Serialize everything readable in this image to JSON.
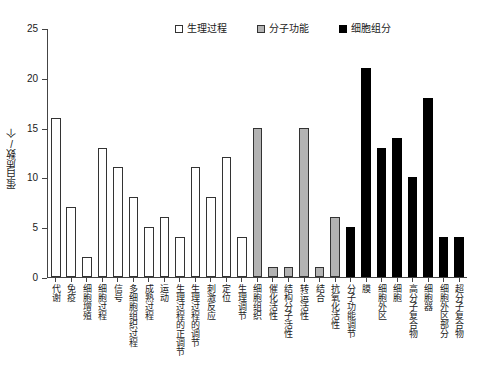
{
  "chart_data": {
    "type": "bar",
    "title": "",
    "xlabel": "",
    "ylabel": "蛋白质数/个",
    "ylim": [
      0,
      25
    ],
    "yticks": [
      0,
      5,
      10,
      15,
      20,
      25
    ],
    "grid": false,
    "legend_position": "top-right",
    "categories": [
      "代谢",
      "免疫",
      "细胞增殖",
      "细胞过程",
      "信号",
      "多细胞组织过程",
      "成熟过程",
      "运动",
      "生理过程的正调节",
      "生理过程的调节",
      "刺激反应",
      "定位",
      "生理调节",
      "细胞组织",
      "催化活性",
      "结构分子活性",
      "转运活性",
      "结合",
      "抗氧化活性",
      "分子功能调节",
      "膜",
      "细胞外区",
      "细胞",
      "高分子复合物",
      "细胞器",
      "细胞外区部分",
      "超分子复合物"
    ],
    "values": [
      16,
      7,
      2,
      13,
      11,
      8,
      5,
      6,
      4,
      11,
      8,
      12,
      4,
      15,
      1,
      1,
      15,
      1,
      6,
      5,
      21,
      13,
      14,
      10,
      18,
      4,
      4
    ],
    "groups": [
      "bp",
      "bp",
      "bp",
      "bp",
      "bp",
      "bp",
      "bp",
      "bp",
      "bp",
      "bp",
      "bp",
      "bp",
      "bp",
      "mf",
      "mf",
      "mf",
      "mf",
      "mf",
      "mf",
      "cc",
      "cc",
      "cc",
      "cc",
      "cc",
      "cc",
      "cc",
      "cc"
    ],
    "series": [
      {
        "name": "生理过程",
        "key": "bp",
        "color": "#ffffff"
      },
      {
        "name": "分子功能",
        "key": "mf",
        "color": "#b3b3b3"
      },
      {
        "name": "细胞组分",
        "key": "cc",
        "color": "#000000"
      }
    ]
  },
  "legend": {
    "items": [
      {
        "label": "生理过程",
        "swatch": "white-square-icon"
      },
      {
        "label": "分子功能",
        "swatch": "gray-square-icon"
      },
      {
        "label": "细胞组分",
        "swatch": "black-square-icon"
      }
    ]
  }
}
